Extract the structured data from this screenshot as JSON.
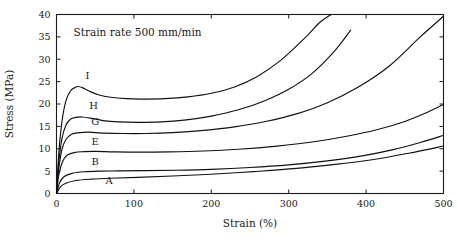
{
  "figure": {
    "annotation": "Strain rate 500 mm/min",
    "background": "#ffffff",
    "curve_color": "#111111"
  },
  "chart_data": {
    "type": "line",
    "title": "",
    "subtitle": "",
    "annotations": [
      "Strain rate 500 mm/min"
    ],
    "xlabel": "Strain (%)",
    "ylabel": "Stress (MPa)",
    "xlim": [
      0,
      500
    ],
    "ylim": [
      0,
      40
    ],
    "xticks": [
      0,
      100,
      200,
      300,
      400,
      500
    ],
    "yticks": [
      0,
      5,
      10,
      15,
      20,
      25,
      30,
      35,
      40
    ],
    "xtick_labels": [
      "0",
      "100",
      "200",
      "300",
      "400",
      "500"
    ],
    "ytick_labels": [
      "0",
      "5",
      "10",
      "15",
      "20",
      "25",
      "30",
      "35",
      "40"
    ],
    "grid": false,
    "legend_position": "inline-curve-labels",
    "series": [
      {
        "name": "I",
        "label": "I",
        "label_x": 40,
        "label_y": 25.6,
        "yield_peak_stress": 23.9,
        "yield_peak_strain": 28,
        "plateau_stress": 21.0,
        "x": [
          0,
          3,
          7,
          12,
          18,
          24,
          28,
          34,
          42,
          55,
          70,
          90,
          110,
          140,
          170,
          200,
          230,
          260,
          290,
          320,
          340,
          355
        ],
        "y": [
          0,
          9.0,
          16.0,
          20.6,
          22.9,
          23.7,
          23.9,
          23.6,
          22.9,
          22.0,
          21.5,
          21.2,
          21.1,
          21.2,
          21.6,
          22.4,
          23.8,
          26.2,
          29.8,
          34.6,
          38.2,
          40.0
        ]
      },
      {
        "name": "H",
        "label": "H",
        "label_x": 48,
        "label_y": 18.8,
        "yield_peak_stress": 17.1,
        "yield_peak_strain": 33,
        "plateau_stress": 16.0,
        "x": [
          0,
          3,
          7,
          12,
          18,
          25,
          33,
          45,
          60,
          80,
          105,
          135,
          165,
          200,
          235,
          270,
          300,
          330,
          360,
          380
        ],
        "y": [
          0,
          7.0,
          12.2,
          15.2,
          16.6,
          17.0,
          17.1,
          16.8,
          16.3,
          16.0,
          15.9,
          16.0,
          16.4,
          17.3,
          18.7,
          20.8,
          23.3,
          26.8,
          32.0,
          36.5
        ]
      },
      {
        "name": "G",
        "label": "G",
        "label_x": 50,
        "label_y": 15.2,
        "yield_peak_stress": 13.7,
        "yield_peak_strain": 40,
        "plateau_stress": 13.3,
        "x": [
          0,
          3,
          7,
          12,
          20,
          30,
          42,
          60,
          85,
          115,
          150,
          190,
          230,
          270,
          310,
          350,
          390,
          430,
          470,
          500
        ],
        "y": [
          0,
          5.6,
          9.8,
          12.0,
          13.3,
          13.6,
          13.7,
          13.5,
          13.4,
          13.4,
          13.6,
          14.1,
          14.9,
          16.1,
          17.8,
          20.3,
          23.8,
          28.5,
          35.0,
          39.6
        ]
      },
      {
        "name": "E",
        "label": "E",
        "label_x": 50,
        "label_y": 10.8,
        "yield_peak_stress": 9.4,
        "yield_peak_strain": 45,
        "plateau_stress": 9.2,
        "x": [
          0,
          3,
          8,
          14,
          24,
          36,
          50,
          75,
          105,
          145,
          190,
          235,
          285,
          330,
          375,
          415,
          450,
          480,
          500
        ],
        "y": [
          0,
          4.2,
          7.2,
          8.6,
          9.2,
          9.35,
          9.4,
          9.3,
          9.25,
          9.3,
          9.5,
          9.9,
          10.6,
          11.5,
          12.8,
          14.3,
          16.1,
          18.2,
          19.9
        ]
      },
      {
        "name": "B",
        "label": "B",
        "label_x": 50,
        "label_y": 6.4,
        "yield_peak_stress": 5.0,
        "yield_peak_strain": 60,
        "plateau_stress": 4.9,
        "x": [
          0,
          4,
          10,
          20,
          35,
          55,
          80,
          115,
          155,
          200,
          250,
          300,
          350,
          395,
          435,
          470,
          500
        ],
        "y": [
          0,
          2.4,
          3.8,
          4.5,
          4.85,
          5.0,
          5.05,
          5.1,
          5.2,
          5.4,
          5.8,
          6.4,
          7.3,
          8.4,
          9.8,
          11.4,
          13.0
        ]
      },
      {
        "name": "A",
        "label": "A",
        "label_x": 68,
        "label_y": 2.1,
        "plateau_stress": 3.2,
        "x": [
          0,
          5,
          12,
          25,
          45,
          70,
          105,
          150,
          200,
          255,
          310,
          360,
          410,
          455,
          500
        ],
        "y": [
          0,
          1.5,
          2.3,
          2.9,
          3.2,
          3.4,
          3.6,
          3.9,
          4.3,
          4.9,
          5.6,
          6.5,
          7.6,
          9.0,
          10.6
        ]
      }
    ]
  }
}
